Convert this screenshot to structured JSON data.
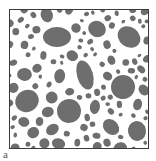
{
  "figure": {
    "panel_label": "a",
    "colors": {
      "grain": "#6e6e6e",
      "boundary": "#ffffff",
      "frame": "#3a3a3a"
    },
    "large_grains": [
      {
        "cx": 48,
        "cy": 28,
        "rx": 14,
        "ry": 10
      },
      {
        "cx": 120,
        "cy": 28,
        "rx": 12,
        "ry": 10
      },
      {
        "cx": 76,
        "cy": 66,
        "rx": 15,
        "ry": 8
      },
      {
        "cx": 114,
        "cy": 78,
        "rx": 12,
        "ry": 12
      },
      {
        "cx": 18,
        "cy": 92,
        "rx": 12,
        "ry": 11
      },
      {
        "cx": 60,
        "cy": 102,
        "rx": 12,
        "ry": 12
      },
      {
        "cx": 102,
        "cy": 118,
        "rx": 9,
        "ry": 7
      },
      {
        "cx": 128,
        "cy": 122,
        "rx": 10,
        "ry": 9
      },
      {
        "cx": 88,
        "cy": 20,
        "rx": 8,
        "ry": 9
      }
    ]
  }
}
